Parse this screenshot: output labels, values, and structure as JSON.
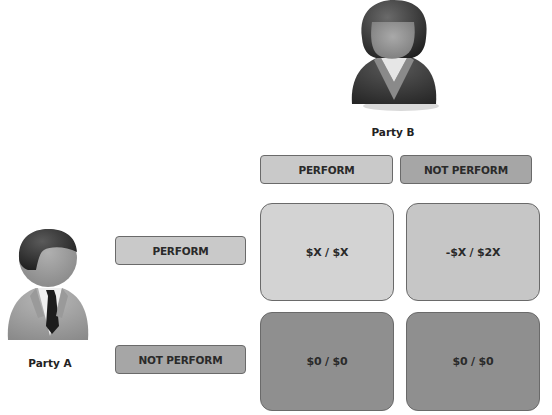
{
  "party_b": {
    "label": "Party B",
    "icon": "female-user-icon"
  },
  "party_a": {
    "label": "Party A",
    "icon": "male-user-icon"
  },
  "columns": [
    {
      "label": "PERFORM",
      "color": "#c9c9c9"
    },
    {
      "label": "NOT PERFORM",
      "color": "#a6a6a6"
    }
  ],
  "rows": [
    {
      "label": "PERFORM",
      "color": "#c9c9c9"
    },
    {
      "label": "NOT PERFORM",
      "color": "#a6a6a6"
    }
  ],
  "cells": [
    [
      {
        "value": "$X / $X",
        "color": "#d3d3d3"
      },
      {
        "value": "-$X / $2X",
        "color": "#c6c6c6"
      }
    ],
    [
      {
        "value": "$0 / $0",
        "color": "#8f8f8f"
      },
      {
        "value": "$0 / $0",
        "color": "#8f8f8f"
      }
    ]
  ]
}
